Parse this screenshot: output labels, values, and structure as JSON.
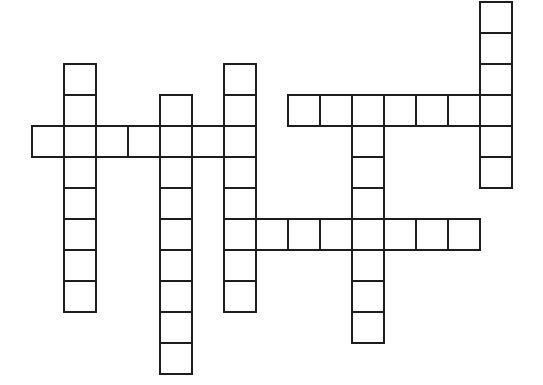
{
  "puzzle": {
    "type": "crossword",
    "cell_width": 32,
    "cell_height": 31,
    "origin_x": 31,
    "origin_y": 1,
    "border_color": "#1e1e1e",
    "background_color": "#ffffff",
    "words": [
      {
        "id": "down-1",
        "direction": "down",
        "col": 14,
        "row": 0,
        "length": 6
      },
      {
        "id": "down-2",
        "direction": "down",
        "col": 1,
        "row": 2,
        "length": 8
      },
      {
        "id": "down-3",
        "direction": "down",
        "col": 4,
        "row": 3,
        "length": 9
      },
      {
        "id": "down-4",
        "direction": "down",
        "col": 6,
        "row": 2,
        "length": 8
      },
      {
        "id": "down-5",
        "direction": "down",
        "col": 10,
        "row": 3,
        "length": 8
      },
      {
        "id": "across-1",
        "direction": "across",
        "col": 0,
        "row": 4,
        "length": 7
      },
      {
        "id": "across-2",
        "direction": "across",
        "col": 8,
        "row": 3,
        "length": 7
      },
      {
        "id": "across-3",
        "direction": "across",
        "col": 6,
        "row": 7,
        "length": 8
      }
    ],
    "letters": {}
  }
}
